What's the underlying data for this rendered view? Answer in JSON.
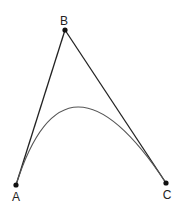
{
  "diagram": {
    "type": "quadratic-bezier",
    "points": {
      "A": {
        "label": "A",
        "x": 16,
        "y": 185
      },
      "B": {
        "label": "B",
        "x": 65,
        "y": 30
      },
      "C": {
        "label": "C",
        "x": 166,
        "y": 183
      }
    },
    "colors": {
      "lines": "#222222",
      "curve": "#555555",
      "points": "#111111"
    }
  }
}
